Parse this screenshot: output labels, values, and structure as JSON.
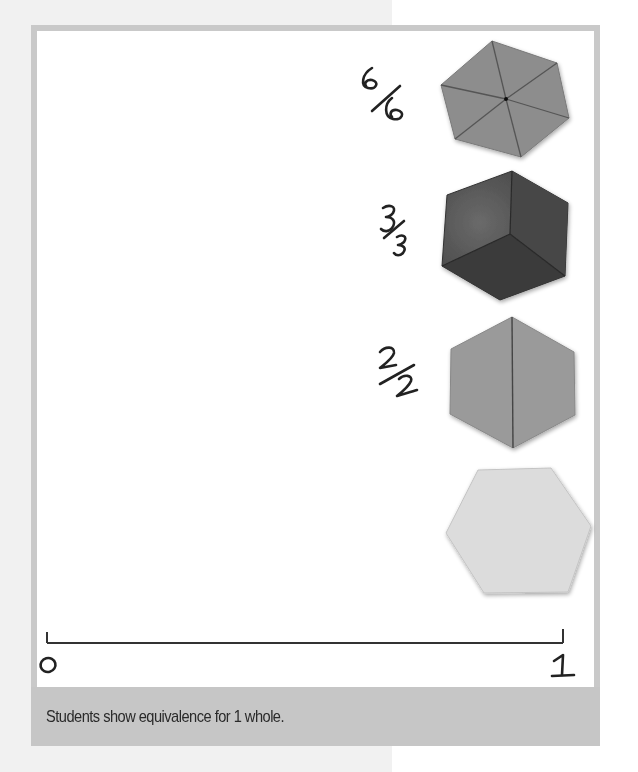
{
  "figure": {
    "caption": "Students show equivalence for 1 whole.",
    "number_line": {
      "start_label": "0",
      "end_label": "1"
    },
    "shapes": [
      {
        "name": "hexagon-sixths",
        "fraction_label": "6/6",
        "parts": 6,
        "color": "#8d8d8d"
      },
      {
        "name": "hexagon-thirds",
        "fraction_label": "3/3",
        "parts": 3,
        "color": "#4a4a4a"
      },
      {
        "name": "hexagon-halves",
        "fraction_label": "2/2",
        "parts": 2,
        "color": "#9a9a9a"
      },
      {
        "name": "hexagon-whole",
        "fraction_label": "",
        "parts": 1,
        "color": "#dcdcdc"
      }
    ],
    "colors": {
      "frame_border": "#c9c9c9",
      "caption_bar": "#c6c6c6",
      "page_left_bg": "#f1f1f1",
      "ink": "#222222"
    }
  }
}
